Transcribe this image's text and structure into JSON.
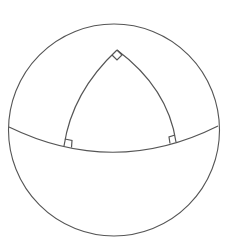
{
  "diagram": {
    "type": "spherical-triangle",
    "colors": {
      "line": "#555555",
      "background": "#ffffff"
    },
    "sphere": {
      "cx": 114,
      "cy": 130,
      "r": 106
    },
    "equator": {
      "start": [
        9,
        127
      ],
      "control": [
        114,
        178
      ],
      "end": [
        218,
        126
      ]
    },
    "vertices": {
      "top": [
        117,
        50
      ],
      "bottom_left": [
        64,
        146
      ],
      "bottom_right": [
        176,
        142
      ]
    },
    "right_angle_markers": 3
  }
}
